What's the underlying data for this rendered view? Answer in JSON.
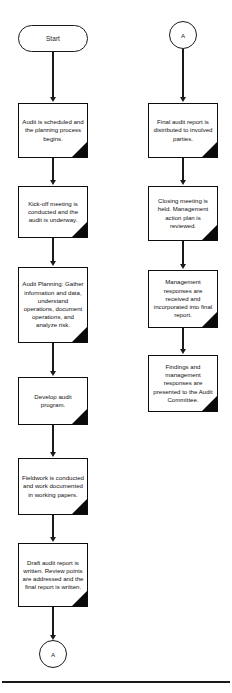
{
  "diagram": {
    "background_color": "#ffffff",
    "line_color": "#1a1a1a",
    "fold_color": "#0a0a0a"
  },
  "left_column": {
    "start": {
      "label": "Start",
      "shape": "terminator"
    },
    "steps": [
      {
        "label": "Audit is scheduled and the planning process begins.",
        "shape": "process"
      },
      {
        "label": "Kick-off meeting is conducted and the audit is underway.",
        "shape": "process"
      },
      {
        "label": "Audit Planning: Gather information and data, understand operations, document operations, and analyze risk.",
        "shape": "process"
      },
      {
        "label": "Develop audit program.",
        "shape": "process"
      },
      {
        "label": "Fieldwork is conducted and work documented in working papers.",
        "shape": "process"
      },
      {
        "label": "Draft audit report is written. Review points are addressed and the final report is written.",
        "shape": "process"
      }
    ],
    "end_connector": {
      "label": "A",
      "shape": "connector"
    }
  },
  "right_column": {
    "start_connector": {
      "label": "A",
      "shape": "connector"
    },
    "steps": [
      {
        "label": "Final audit report is distributed to involved parties.",
        "shape": "process"
      },
      {
        "label": "Closing meeting is held. Management action plan is reviewed.",
        "shape": "process"
      },
      {
        "label": "Management responses are received and incorporated into final report.",
        "shape": "process"
      },
      {
        "label": "Findings and management responses are presented to the Audit Committee.",
        "shape": "process"
      }
    ]
  }
}
